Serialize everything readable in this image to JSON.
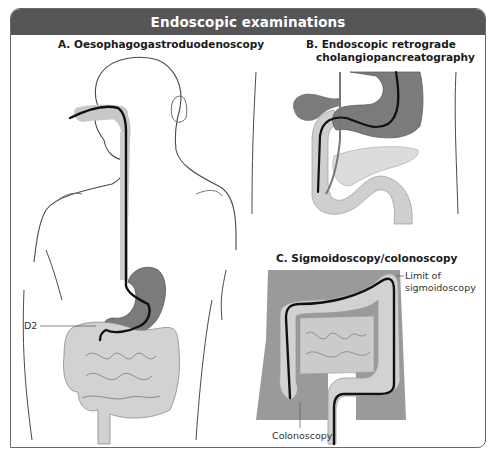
{
  "title": "Endoscopic examinations",
  "panels": {
    "a": {
      "title": "A. Oesophagogastroduodenoscopy",
      "labels": {
        "d2": "D2"
      }
    },
    "b": {
      "title_line1": "B. Endoscopic retrograde",
      "title_line2": "cholangiopancreatography"
    },
    "c": {
      "title": "C. Sigmoidoscopy/colonoscopy",
      "labels": {
        "limit_line1": "Limit  of",
        "limit_line2": "sigmoidoscopy",
        "colonoscopy": "Colonoscopy"
      }
    }
  },
  "colors": {
    "title_bar": "#555557",
    "organ_dark": "#7a7a7c",
    "organ_light": "#d2d2d2",
    "skin_fill": "#9a9a9a",
    "endoscope": "#111111",
    "outline": "#5a5a5a"
  }
}
